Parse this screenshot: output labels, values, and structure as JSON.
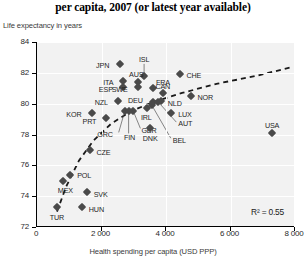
{
  "title": "per capita, 2007 (or latest year available)",
  "axes": {
    "ylabel": "Life expectancy in years",
    "xlabel": "Health spending per capita (USD PPP)",
    "yticks": [
      "72",
      "74",
      "76",
      "78",
      "80",
      "82",
      "84"
    ],
    "xticks": [
      "0",
      "2 000",
      "4 000",
      "6 000",
      "8 000"
    ]
  },
  "annotation": {
    "r2": "R² = 0.55"
  },
  "colors": {
    "marker": "#4a4a4a",
    "plot_background": "#f2f2f2",
    "gridline": "#ffffff",
    "axis": "#000000",
    "trendline": "#1a1a1a"
  },
  "chart_data": {
    "type": "scatter",
    "title": "per capita, 2007 (or latest year available)",
    "xlabel": "Health spending per capita (USD PPP)",
    "ylabel": "Life expectancy in years",
    "xlim": [
      0,
      8000
    ],
    "ylim": [
      72,
      84
    ],
    "grid": true,
    "legend": null,
    "annotations": [
      "R² = 0.55"
    ],
    "trendline": {
      "style": "dashed",
      "description": "logarithmic fit rising steeply from low spending then flattening",
      "points": [
        [
          620,
          73.0
        ],
        [
          900,
          74.6
        ],
        [
          1300,
          76.3
        ],
        [
          1750,
          77.6
        ],
        [
          2300,
          78.7
        ],
        [
          2900,
          79.5
        ],
        [
          3600,
          80.1
        ],
        [
          4500,
          80.7
        ],
        [
          5600,
          81.3
        ],
        [
          6800,
          81.8
        ],
        [
          7950,
          82.4
        ]
      ]
    },
    "points": [
      {
        "label": "JPN",
        "x": 2580,
        "y": 82.6,
        "label_pos": "left"
      },
      {
        "label": "ISL",
        "x": 3320,
        "y": 81.8,
        "label_pos": "leader-up"
      },
      {
        "label": "AUS",
        "x": 3140,
        "y": 81.4,
        "label_pos": "above"
      },
      {
        "label": "ITA",
        "x": 2680,
        "y": 81.5,
        "label_pos": "left"
      },
      {
        "label": "FRA",
        "x": 3600,
        "y": 81.0,
        "label_pos": "above"
      },
      {
        "label": "CHE",
        "x": 4420,
        "y": 81.9,
        "label_pos": "right"
      },
      {
        "label": "ESP",
        "x": 2660,
        "y": 81.1,
        "label_pos": "left"
      },
      {
        "label": "SWE",
        "x": 3120,
        "y": 81.1,
        "label_pos": "left"
      },
      {
        "label": "CAN",
        "x": 3900,
        "y": 80.7,
        "label_pos": "above"
      },
      {
        "label": "NOR",
        "x": 4760,
        "y": 80.5,
        "label_pos": "right"
      },
      {
        "label": "NZL",
        "x": 2510,
        "y": 80.2,
        "label_pos": "left"
      },
      {
        "label": "DEU",
        "x": 3590,
        "y": 80.1,
        "label_pos": "left"
      },
      {
        "label": "NLD",
        "x": 3840,
        "y": 80.2,
        "label_pos": "right"
      },
      {
        "label": "KOR",
        "x": 1690,
        "y": 79.4,
        "label_pos": "left"
      },
      {
        "label": "LUX",
        "x": 4160,
        "y": 79.4,
        "label_pos": "right"
      },
      {
        "label": "IRL",
        "x": 3420,
        "y": 79.7,
        "label_pos": "below"
      },
      {
        "label": "AUT",
        "x": 3760,
        "y": 80.1,
        "label_pos": "leader"
      },
      {
        "label": "BEL",
        "x": 3560,
        "y": 79.9,
        "label_pos": "leader"
      },
      {
        "label": "PRT",
        "x": 2150,
        "y": 79.1,
        "label_pos": "left"
      },
      {
        "label": "GBR",
        "x": 2990,
        "y": 79.5,
        "label_pos": "leader"
      },
      {
        "label": "GRC",
        "x": 2720,
        "y": 79.5,
        "label_pos": "leader"
      },
      {
        "label": "FIN",
        "x": 2840,
        "y": 79.5,
        "label_pos": "leader"
      },
      {
        "label": "DNK",
        "x": 3510,
        "y": 78.4,
        "label_pos": "below"
      },
      {
        "label": "USA",
        "x": 7290,
        "y": 78.1,
        "label_pos": "above"
      },
      {
        "label": "CZE",
        "x": 1630,
        "y": 77.0,
        "label_pos": "right"
      },
      {
        "label": "POL",
        "x": 1030,
        "y": 75.4,
        "label_pos": "right"
      },
      {
        "label": "MEX",
        "x": 820,
        "y": 75.0,
        "label_pos": "below"
      },
      {
        "label": "SVK",
        "x": 1540,
        "y": 74.3,
        "label_pos": "right"
      },
      {
        "label": "HUN",
        "x": 1390,
        "y": 73.3,
        "label_pos": "right"
      },
      {
        "label": "TUR",
        "x": 620,
        "y": 73.3,
        "label_pos": "below"
      }
    ]
  }
}
